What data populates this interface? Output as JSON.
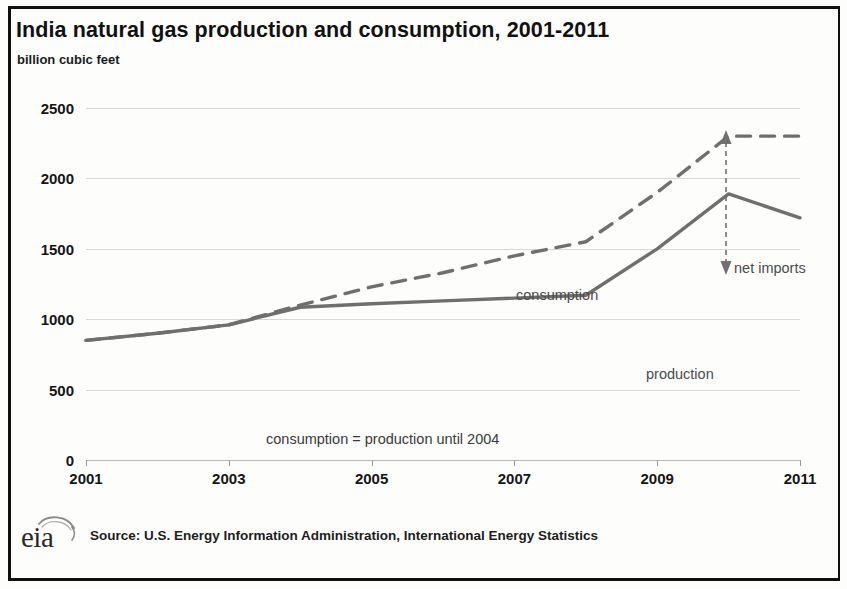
{
  "chart_data": {
    "type": "line",
    "title": "India natural gas production and consumption, 2001-2011",
    "subtitle": "billion cubic feet",
    "ylabel": "billion cubic feet",
    "xlabel": "",
    "ylim": [
      0,
      2500
    ],
    "yticks": [
      0,
      500,
      1000,
      1500,
      2000,
      2500
    ],
    "ytick_labels": [
      "0",
      "500",
      "1000",
      "1500",
      "2000",
      "2500"
    ],
    "xlim": [
      2001,
      2011
    ],
    "xticks": [
      2001,
      2003,
      2005,
      2007,
      2009,
      2011
    ],
    "xtick_labels": [
      "2001",
      "2003",
      "2005",
      "2007",
      "2009",
      "2011"
    ],
    "x": [
      2001,
      2002,
      2003,
      2004,
      2005,
      2006,
      2007,
      2008,
      2009,
      2010,
      2011
    ],
    "grid": true,
    "legend": "none",
    "series": [
      {
        "name": "consumption",
        "style": "dashed",
        "color": "#6f6f6f",
        "values": [
          850,
          900,
          960,
          1100,
          1230,
          1330,
          1450,
          1550,
          1900,
          2300,
          2300
        ]
      },
      {
        "name": "production",
        "style": "solid",
        "color": "#6f6f6f",
        "values": [
          850,
          900,
          960,
          1085,
          1110,
          1130,
          1150,
          1170,
          1500,
          1890,
          1720
        ]
      }
    ],
    "annotations": [
      {
        "id": "consumption",
        "text": "consumption"
      },
      {
        "id": "production",
        "text": "production"
      },
      {
        "id": "net-imports",
        "text": "net imports"
      },
      {
        "id": "equality-note",
        "text": "consumption = production until 2004"
      }
    ]
  },
  "footer": {
    "logo_text": "eia",
    "source": "Source: U.S. Energy Information Administration, International Energy Statistics"
  }
}
